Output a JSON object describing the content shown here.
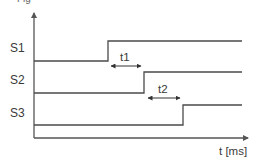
{
  "diagram": {
    "type": "timing-diagram",
    "top_cropped_text": "Fig",
    "colors": {
      "line": "#4a4a4a",
      "axis": "#555555",
      "text": "#3a3a3a",
      "background": "#ffffff"
    },
    "axes": {
      "x_label": "t [ms]",
      "origin": [
        34,
        138
      ],
      "x_end": 249,
      "y_top": 12
    },
    "signals": [
      {
        "name": "S1",
        "label_pos": [
          18,
          48
        ],
        "low_y": 61,
        "high_y": 41,
        "rise_x": 108,
        "start_x": 34,
        "end_x": 242
      },
      {
        "name": "S2",
        "label_pos": [
          18,
          80
        ],
        "low_y": 93,
        "high_y": 72,
        "rise_x": 144,
        "start_x": 34,
        "end_x": 242
      },
      {
        "name": "S3",
        "label_pos": [
          18,
          113
        ],
        "low_y": 125,
        "high_y": 105,
        "rise_x": 183,
        "start_x": 34,
        "end_x": 242
      }
    ],
    "intervals": [
      {
        "name": "t1",
        "from_x": 110,
        "to_x": 142,
        "y": 66,
        "label_pos": [
          126,
          60
        ]
      },
      {
        "name": "t2",
        "from_x": 147,
        "to_x": 181,
        "y": 98,
        "label_pos": [
          164,
          92
        ]
      }
    ]
  }
}
